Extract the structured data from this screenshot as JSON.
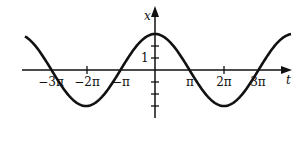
{
  "diagram": {
    "type": "cosine-graph",
    "function": "x = A cos(t / 2)",
    "axes": {
      "horizontal": "t",
      "vertical": "x"
    },
    "y_tick_label": "1",
    "x_ticks": [
      {
        "label": "−3π",
        "px": 51
      },
      {
        "label": "−2π",
        "px": 87
      },
      {
        "label": "−π",
        "px": 121
      },
      {
        "label": "π",
        "px": 190
      },
      {
        "label": "2π",
        "px": 224
      },
      {
        "label": "3π",
        "px": 258
      }
    ]
  },
  "chart_data": {
    "type": "line",
    "title": "",
    "xlabel": "t",
    "ylabel": "x",
    "x_tick_labels": [
      "-3π",
      "-2π",
      "-π",
      "π",
      "2π",
      "3π"
    ],
    "y_tick_labels": [
      "1"
    ],
    "series": [
      {
        "name": "x(t)",
        "description": "cosine with period 4π, amplitude ~1.5, max at t=0, zeros at ±π, ±3π, minima at ±2π"
      }
    ],
    "grid": false
  }
}
